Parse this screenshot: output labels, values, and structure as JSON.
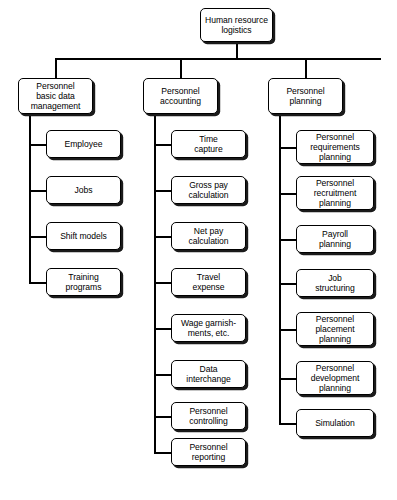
{
  "diagram": {
    "title": "Human resource logistics",
    "root": {
      "label": "Human resource logistics"
    },
    "columns": [
      {
        "header": "Personnel\nbasic data\nmanagement",
        "header_plain": "Personnel basic data management",
        "children": [
          {
            "label": "Employee"
          },
          {
            "label": "Jobs"
          },
          {
            "label": "Shift models"
          },
          {
            "label": "Training\nprograms"
          }
        ]
      },
      {
        "header": "Personnel\naccounting",
        "header_plain": "Personnel accounting",
        "children": [
          {
            "label": "Time\ncapture"
          },
          {
            "label": "Gross pay\ncalculation"
          },
          {
            "label": "Net pay\ncalculation"
          },
          {
            "label": "Travel\nexpense"
          },
          {
            "label": "Wage garnish-\nments, etc."
          },
          {
            "label": "Data\ninterchange"
          },
          {
            "label": "Personnel\ncontrolling"
          },
          {
            "label": "Personnel\nreporting"
          }
        ]
      },
      {
        "header": "Personnel\nplanning",
        "header_plain": "Personnel planning",
        "children": [
          {
            "label": "Personnel\nrequirements\nplanning"
          },
          {
            "label": "Personnel\nrecruitment\nplanning"
          },
          {
            "label": "Payroll\nplanning"
          },
          {
            "label": "Job\nstructuring"
          },
          {
            "label": "Personnel\nplacement\nplanning"
          },
          {
            "label": "Personnel\ndevelopment\nplanning"
          },
          {
            "label": "Simulation"
          }
        ]
      }
    ],
    "caption": "",
    "colors": {
      "line": "#000000",
      "box_fill": "#ffffff",
      "shadow": "#1a1a1a"
    }
  }
}
